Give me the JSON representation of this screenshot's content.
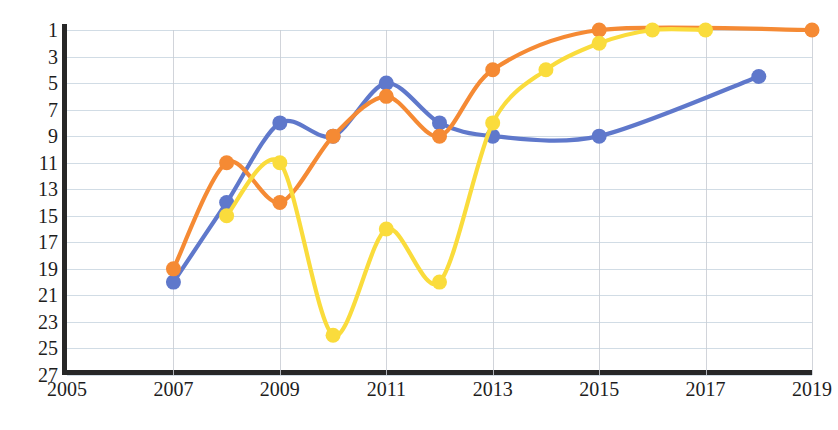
{
  "chart_data": {
    "type": "line",
    "title": "",
    "subtitle": "",
    "xlabel": "",
    "ylabel": "",
    "grid": true,
    "legend": "none",
    "y_axis_inverted": true,
    "xlim": [
      2005,
      2019
    ],
    "ylim": [
      27,
      1
    ],
    "x_ticks": [
      2005,
      2007,
      2009,
      2011,
      2013,
      2015,
      2017,
      2019
    ],
    "x_tick_labels": [
      "2005",
      "2007",
      "2009",
      "2011",
      "2013",
      "2015",
      "2017",
      "2019"
    ],
    "x_gridlines": [
      2007,
      2009,
      2011,
      2013,
      2015,
      2017,
      2019
    ],
    "y_ticks": [
      1,
      3,
      5,
      7,
      9,
      11,
      13,
      15,
      17,
      19,
      21,
      23,
      25,
      27
    ],
    "y_tick_labels": [
      "1",
      "3",
      "5",
      "7",
      "9",
      "11",
      "13",
      "15",
      "17",
      "19",
      "21",
      "23",
      "25",
      "27"
    ],
    "series": [
      {
        "name": "blue-series",
        "color": "#5F78CB",
        "marker": "circle",
        "x": [
          2007,
          2008,
          2009,
          2010,
          2011,
          2012,
          2013,
          2015,
          2018
        ],
        "values": [
          20,
          14,
          8,
          9,
          5,
          8,
          9,
          9,
          4.5
        ]
      },
      {
        "name": "orange-series",
        "color": "#F58A34",
        "marker": "circle",
        "x": [
          2007,
          2008,
          2009,
          2010,
          2011,
          2012,
          2013,
          2015,
          2019
        ],
        "values": [
          19,
          11,
          14,
          9,
          6,
          9,
          4,
          1,
          1
        ]
      },
      {
        "name": "yellow-series",
        "color": "#FADC3C",
        "marker": "circle",
        "x": [
          2008,
          2009,
          2010,
          2011,
          2012,
          2013,
          2014,
          2015,
          2016,
          2017
        ],
        "values": [
          15,
          11,
          24,
          16,
          20,
          8,
          4,
          2,
          1,
          1
        ]
      }
    ]
  },
  "axes": {
    "axis_color": "#272727",
    "grid_color_h": "#c9d6e0",
    "grid_color_v": "#c9ccd4"
  }
}
